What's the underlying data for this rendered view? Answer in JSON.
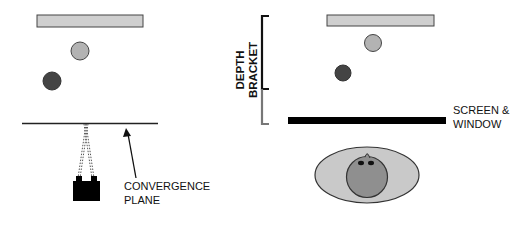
{
  "colors": {
    "light_gray": "#cfcfcf",
    "mid_gray": "#a9a9a9",
    "dark_circle": "#444444",
    "black": "#111111",
    "bracket_gray": "#777777",
    "head_gray": "#8f8f8f",
    "ellipse_gray": "#c9c9c9"
  },
  "left_panel": {
    "convergence_label_line1": "CONVERGENCE",
    "convergence_label_line2": "PLANE",
    "elements": [
      "background-plane-bar",
      "far-object-circle",
      "near-object-circle",
      "convergence-plane-line",
      "stereo-camera",
      "convergence-arrow"
    ]
  },
  "right_panel": {
    "depth_label_line1": "DEPTH",
    "depth_label_line2": "BRACKET",
    "screen_label_line1": "SCREEN &",
    "screen_label_line2": "WINDOW",
    "elements": [
      "background-plane-bar",
      "far-object-circle",
      "near-object-circle",
      "depth-bracket",
      "screen-bar",
      "viewer-head"
    ]
  }
}
